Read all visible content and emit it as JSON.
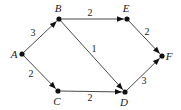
{
  "diagram": {
    "type": "directed-weighted-graph",
    "nodes": [
      {
        "id": "A",
        "label": "A",
        "x": 22,
        "y": 54,
        "lx": 14,
        "ly": 58
      },
      {
        "id": "B",
        "label": "B",
        "x": 59,
        "y": 19,
        "lx": 58,
        "ly": 12
      },
      {
        "id": "C",
        "label": "C",
        "x": 58,
        "y": 91,
        "lx": 57,
        "ly": 105
      },
      {
        "id": "D",
        "label": "D",
        "x": 125,
        "y": 92,
        "lx": 124,
        "ly": 106
      },
      {
        "id": "E",
        "label": "E",
        "x": 127,
        "y": 19,
        "lx": 126,
        "ly": 12
      },
      {
        "id": "F",
        "label": "F",
        "x": 162,
        "y": 56,
        "lx": 169,
        "ly": 60
      }
    ],
    "edges": [
      {
        "from": "A",
        "to": "B",
        "weight": "3",
        "lx": 33,
        "ly": 36
      },
      {
        "from": "A",
        "to": "C",
        "weight": "2",
        "lx": 31,
        "ly": 77
      },
      {
        "from": "B",
        "to": "E",
        "weight": "2",
        "lx": 90,
        "ly": 16
      },
      {
        "from": "B",
        "to": "D",
        "weight": "1",
        "lx": 94,
        "ly": 52
      },
      {
        "from": "C",
        "to": "D",
        "weight": "2",
        "lx": 90,
        "ly": 101
      },
      {
        "from": "E",
        "to": "F",
        "weight": "2",
        "lx": 147,
        "ly": 35
      },
      {
        "from": "D",
        "to": "F",
        "weight": "3",
        "lx": 144,
        "ly": 84
      }
    ]
  }
}
